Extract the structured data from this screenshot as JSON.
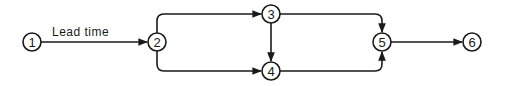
{
  "diagram": {
    "type": "network-activity-diagram",
    "nodes": [
      {
        "id": "1",
        "label": "1",
        "x": 32,
        "y": 42
      },
      {
        "id": "2",
        "label": "2",
        "x": 157,
        "y": 42
      },
      {
        "id": "3",
        "label": "3",
        "x": 271,
        "y": 14
      },
      {
        "id": "4",
        "label": "4",
        "x": 271,
        "y": 71
      },
      {
        "id": "5",
        "label": "5",
        "x": 382,
        "y": 42
      },
      {
        "id": "6",
        "label": "6",
        "x": 472,
        "y": 42
      }
    ],
    "edges": [
      {
        "from": "1",
        "to": "2",
        "label": "Lead time"
      },
      {
        "from": "2",
        "to": "3",
        "label": ""
      },
      {
        "from": "2",
        "to": "4",
        "label": ""
      },
      {
        "from": "3",
        "to": "4",
        "label": ""
      },
      {
        "from": "3",
        "to": "5",
        "label": ""
      },
      {
        "from": "4",
        "to": "5",
        "label": ""
      },
      {
        "from": "5",
        "to": "6",
        "label": ""
      }
    ],
    "edge_label_1_2": "Lead time",
    "colors": {
      "stroke": "#1a1a1a",
      "background": "#ffffff"
    }
  }
}
